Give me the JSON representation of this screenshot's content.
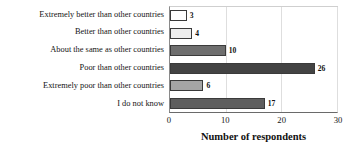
{
  "chart_data": {
    "type": "bar",
    "orientation": "horizontal",
    "title": "",
    "xlabel": "Number of respondents",
    "ylabel": "",
    "xlim": [
      0,
      30
    ],
    "xticks": [
      0,
      10,
      20,
      30
    ],
    "grid": true,
    "legend": false,
    "categories": [
      "Extremely better than other countries",
      "Better than other countries",
      "About the same as other countries",
      "Poor than other countries",
      "Extremely poor than other countries",
      "I do not know"
    ],
    "values": [
      3,
      4,
      10,
      26,
      6,
      17
    ],
    "value_labels": [
      "3",
      "4",
      "10",
      "26",
      "6",
      "17"
    ],
    "bar_colors": [
      "#ffffff",
      "#ededed",
      "#6e6e6e",
      "#434343",
      "#a5a5a5",
      "#5e5e5e"
    ],
    "bar_border_color": "#3a3a3a"
  },
  "axis": {
    "x_tick_labels": [
      "0",
      "10",
      "20",
      "30"
    ],
    "x_axis_title": "Number of respondents"
  },
  "colors": {
    "background": "#ffffff",
    "text": "#141414",
    "gridline": "#dedede",
    "plot_border": "#cfcfcf",
    "axis_line": "#6a6a6a"
  }
}
